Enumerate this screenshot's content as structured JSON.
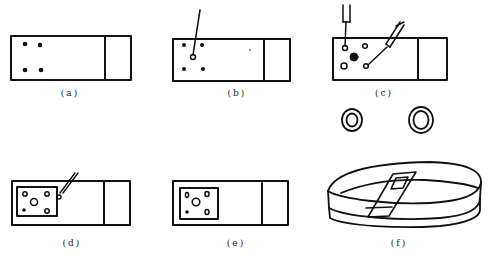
{
  "figure": {
    "stroke_color": "#111111",
    "background": "#ffffff",
    "panels": [
      {
        "id": "a",
        "label": "(a)",
        "description": "glass slide with four marked dots"
      },
      {
        "id": "b",
        "label": "(b)",
        "description": "needle pointing at a dot on slide"
      },
      {
        "id": "c",
        "label": "(c)",
        "description": "two needles/forceps placing samples; rings below"
      },
      {
        "id": "d",
        "label": "(d)",
        "description": "coverslip placed over samples, needle at edge"
      },
      {
        "id": "e",
        "label": "(e)",
        "description": "slide with coverslip over samples"
      },
      {
        "id": "f",
        "label": "(f)",
        "description": "slide placed in petri dish"
      }
    ]
  }
}
